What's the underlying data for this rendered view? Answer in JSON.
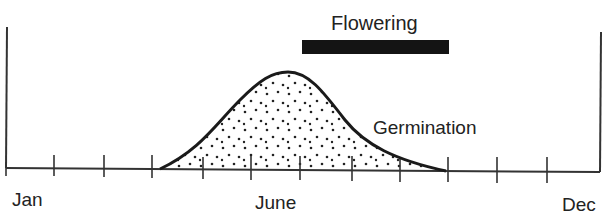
{
  "diagram": {
    "axis": {
      "start_label": "Jan",
      "mid_label": "June",
      "end_label": "Dec",
      "tick_count": 13
    },
    "flowering": {
      "label": "Flowering",
      "start_month_approx": 6,
      "end_month_approx": 9,
      "color": "#141414"
    },
    "germination": {
      "label": "Germination",
      "start_month_approx": 3.2,
      "peak_month_approx": 5.7,
      "end_month_approx": 9,
      "fill": "stippled"
    }
  }
}
